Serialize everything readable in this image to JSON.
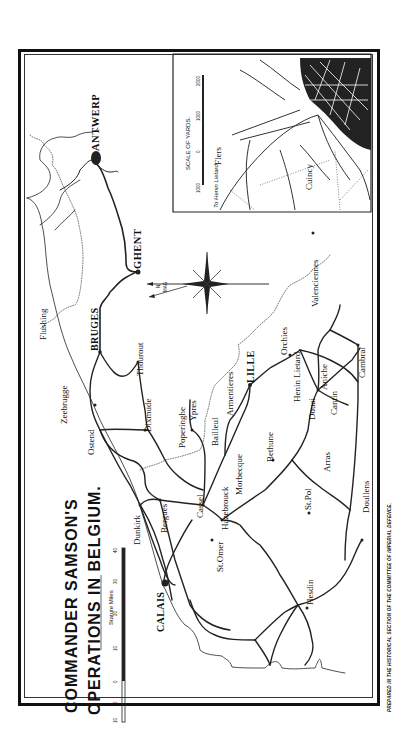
{
  "title": {
    "line1": "COMMANDER SAMSON'S",
    "line2": "OPERATIONS IN BELGIUM."
  },
  "footer": "PREPARED IN THE HISTORICAL SECTION OF THE COMMITTEE OF IMPERIAL DEFENCE.",
  "scale": {
    "label": "Statute Miles",
    "ticks": [
      "10",
      "5",
      "0",
      "10",
      "20",
      "30",
      "40"
    ]
  },
  "compass": {
    "true_north": "N",
    "magnetic_north": "MAG"
  },
  "inset": {
    "scale_label": "SCALE OF YARDS.",
    "scale_ticks": [
      "1000",
      "0",
      "1000",
      "2000"
    ],
    "places": {
      "flers": "Flers",
      "cuincy": "Cuincy",
      "road": "To Henin Lietard"
    }
  },
  "towns": {
    "antwerp": "ANTWERP",
    "ghent": "GHENT",
    "bruges": "BRUGES",
    "flushing": "Flushing",
    "zeebrugge": "Zeebrugge",
    "ostend": "Ostend",
    "thourout": "Thourout",
    "dixmude": "Dixmude",
    "poperinghe": "Poperinghe",
    "ypres": "Ypres",
    "bailleul": "Bailleul",
    "armentieres": "Armentieres",
    "lille": "LILLE",
    "orchies": "Orchies",
    "valenciennes": "Valenciennes",
    "henin_lietard": "Henin Lietard",
    "douai": "Douai",
    "aniche": "Aniche",
    "cantin": "Cantin",
    "cambrai": "Cambrai",
    "morbecque": "Morbecque",
    "bethune": "Bethune",
    "arras": "Arras",
    "doullens": "Doullens",
    "st_pol": "St.Pol",
    "hesdin": "Hesdin",
    "dunkirk": "Dunkirk",
    "bergues": "Bergues",
    "cassel": "Cassel",
    "hazebrouck": "Hazebrouck",
    "st_omer": "St.Omer",
    "calais": "CALAIS"
  }
}
